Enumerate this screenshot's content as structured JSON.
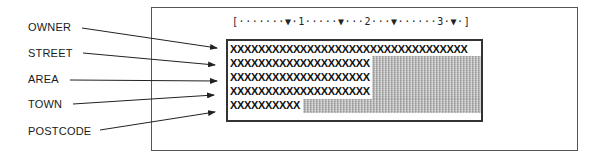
{
  "diagram": {
    "field_labels": [
      {
        "id": "owner",
        "text": "OWNER"
      },
      {
        "id": "street",
        "text": "STREET"
      },
      {
        "id": "area",
        "text": "AREA"
      },
      {
        "id": "town",
        "text": "TOWN"
      },
      {
        "id": "postcode",
        "text": "POSTCODE"
      }
    ],
    "ruler": "[·······▼·1·····▼···2···▼······3·▼·]",
    "screen_rows": [
      {
        "field": "owner",
        "text": "XXXXXXXXXXXXXXXXXXXXXXXXXXXXXXXXXX",
        "length": 34
      },
      {
        "field": "street",
        "text": "XXXXXXXXXXXXXXXXXXXX",
        "length": 20
      },
      {
        "field": "area",
        "text": "XXXXXXXXXXXXXXXXXXXX",
        "length": 20
      },
      {
        "field": "town",
        "text": "XXXXXXXXXXXXXXXXXXXX",
        "length": 20
      },
      {
        "field": "postcode",
        "text": "XXXXXXXXXX",
        "length": 10
      }
    ],
    "colors": {
      "line": "#333333",
      "shaded_fill": "#b0b0b0",
      "background": "#ffffff"
    }
  }
}
